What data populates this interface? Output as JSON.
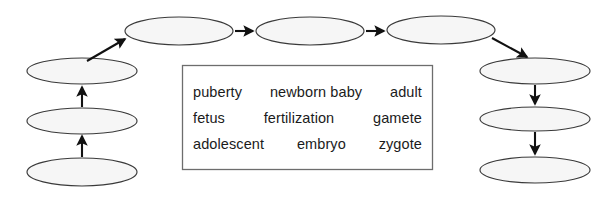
{
  "diagram": {
    "kind": "life-cycle-flow-chart",
    "fill_color": "#f6f6f6",
    "outline_color": "#3a3a3a",
    "arrow_color": "#111111",
    "box_border_color": "#6d6d6d",
    "background_color": "#ffffff",
    "nodes": [
      {
        "id": "left-bottom",
        "label": "",
        "cx": 82,
        "cy": 172,
        "rx": 55,
        "ry": 14
      },
      {
        "id": "left-middle",
        "label": "",
        "cx": 82,
        "cy": 121,
        "rx": 55,
        "ry": 13
      },
      {
        "id": "left-top",
        "label": "",
        "cx": 82,
        "cy": 71,
        "rx": 55,
        "ry": 13
      },
      {
        "id": "top-first",
        "label": "",
        "cx": 179,
        "cy": 31,
        "rx": 54,
        "ry": 14
      },
      {
        "id": "top-second",
        "label": "",
        "cx": 310,
        "cy": 31,
        "rx": 54,
        "ry": 14
      },
      {
        "id": "top-third",
        "label": "",
        "cx": 441,
        "cy": 30,
        "rx": 54,
        "ry": 14
      },
      {
        "id": "right-top",
        "label": "",
        "cx": 535,
        "cy": 71,
        "rx": 55,
        "ry": 13
      },
      {
        "id": "right-middle",
        "label": "",
        "cx": 535,
        "cy": 119,
        "rx": 55,
        "ry": 12
      },
      {
        "id": "right-bottom",
        "label": "",
        "cx": 535,
        "cy": 170,
        "rx": 55,
        "ry": 13
      }
    ],
    "arrows": [
      {
        "id": "arrow-left-bottom-to-left-middle",
        "from": "left-bottom",
        "to": "left-middle",
        "direction": "up"
      },
      {
        "id": "arrow-left-middle-to-left-top",
        "from": "left-middle",
        "to": "left-top",
        "direction": "up"
      },
      {
        "id": "arrow-left-top-to-top-first",
        "from": "left-top",
        "to": "top-first",
        "direction": "diagonal-up-right"
      },
      {
        "id": "arrow-top-first-to-top-second",
        "from": "top-first",
        "to": "top-second",
        "direction": "right"
      },
      {
        "id": "arrow-top-second-to-top-third",
        "from": "top-second",
        "to": "top-third",
        "direction": "right"
      },
      {
        "id": "arrow-top-third-to-right-top",
        "from": "top-third",
        "to": "right-top",
        "direction": "diagonal-down-right"
      },
      {
        "id": "arrow-right-top-to-right-middle",
        "from": "right-top",
        "to": "right-middle",
        "direction": "down"
      },
      {
        "id": "arrow-right-middle-to-right-bottom",
        "from": "right-middle",
        "to": "right-bottom",
        "direction": "down"
      }
    ]
  },
  "word_bank": {
    "rows": [
      {
        "cells": [
          "puberty",
          "newborn baby",
          "adult"
        ]
      },
      {
        "cells": [
          "fetus",
          "fertilization",
          "gamete"
        ]
      },
      {
        "cells": [
          "adolescent",
          "embryo",
          "zygote"
        ]
      }
    ]
  }
}
